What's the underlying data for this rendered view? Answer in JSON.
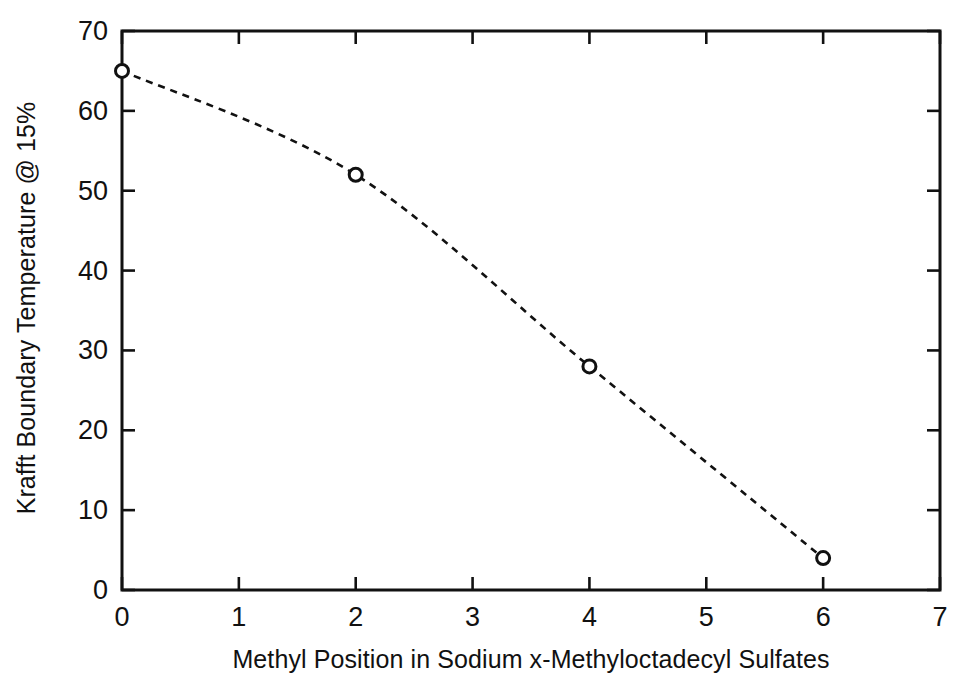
{
  "chart_data": {
    "type": "line",
    "title": "",
    "subtitle": "",
    "xlabel": "Methyl Position in Sodium x-Methyloctadecyl Sulfates",
    "ylabel": "Krafft Boundary Temperature @ 15%",
    "x": [
      0,
      2,
      4,
      6
    ],
    "values": [
      65,
      52,
      28,
      4
    ],
    "series": [
      {
        "name": "Krafft boundary temperature",
        "x": [
          0,
          2,
          4,
          6
        ],
        "values": [
          65,
          52,
          28,
          4
        ],
        "marker": "open-circle",
        "linestyle": "dashed",
        "color": "#111111"
      }
    ],
    "xlim": [
      0,
      7
    ],
    "ylim": [
      0,
      70
    ],
    "xticks": [
      0,
      1,
      2,
      3,
      4,
      5,
      6,
      7
    ],
    "yticks": [
      0,
      10,
      20,
      30,
      40,
      50,
      60,
      70
    ],
    "xtick_labels": [
      "0",
      "1",
      "2",
      "3",
      "4",
      "5",
      "6",
      "7"
    ],
    "ytick_labels": [
      "0",
      "10",
      "20",
      "30",
      "40",
      "50",
      "60",
      "70"
    ],
    "grid": false,
    "legend": null,
    "legend_position": "none",
    "frame": "full-box",
    "tick_direction": "in",
    "annotations": []
  },
  "style": {
    "background": "#ffffff",
    "ink": "#111111",
    "axis_color": "#111111"
  }
}
